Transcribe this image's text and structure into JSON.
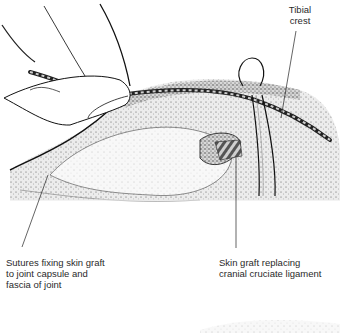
{
  "figure": {
    "type": "surgical illustration",
    "labels": {
      "tibial_crest": "Tibial\ncrest",
      "sutures": "Sutures fixing skin graft\nto joint capsule and\nfascia of joint",
      "skin_graft": "Skin graft replacing\ncranial cruciate ligament"
    }
  }
}
